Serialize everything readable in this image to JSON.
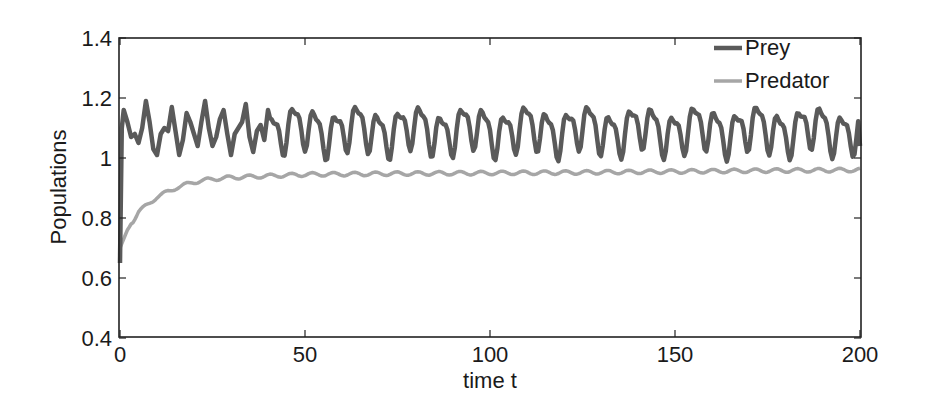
{
  "chart_data": {
    "type": "line",
    "title": "",
    "xlabel": "time t",
    "ylabel": "Populations",
    "xlim": [
      0,
      200
    ],
    "ylim": [
      0.4,
      1.4
    ],
    "xticks": [
      0,
      50,
      100,
      150,
      200
    ],
    "xtick_labels": [
      "0",
      "50",
      "100",
      "150",
      "200"
    ],
    "yticks": [
      0.4,
      0.6,
      0.8,
      1.0,
      1.2,
      1.4
    ],
    "ytick_labels": [
      "0.4",
      "0.6",
      "0.8",
      "1",
      "1.2",
      "1.4"
    ],
    "grid": false,
    "legend_position": "upper right",
    "series": [
      {
        "name": "Prey",
        "color": "#5a5a5a",
        "description": "Starts near 0.65 at t=0, jumps to ~1.16, then oscillates irregularly between ~1.01 and ~1.19 with period ~5.7 and secondary bumps near 1.07-1.10; ends ~1.04 at t=200",
        "x": [
          0,
          0.5,
          1,
          2,
          3,
          4,
          5,
          6,
          7,
          8,
          9,
          10,
          11,
          12,
          13,
          14,
          15,
          16,
          17,
          18,
          19,
          20,
          21,
          22,
          23,
          24,
          25,
          26,
          27,
          28,
          29,
          30,
          31,
          32,
          33,
          34,
          35,
          36,
          37,
          38,
          39,
          40
        ],
        "values": [
          0.65,
          1.1,
          1.16,
          1.12,
          1.07,
          1.08,
          1.05,
          1.1,
          1.19,
          1.12,
          1.03,
          1.01,
          1.08,
          1.1,
          1.09,
          1.17,
          1.09,
          1.01,
          1.06,
          1.15,
          1.12,
          1.08,
          1.04,
          1.12,
          1.19,
          1.1,
          1.04,
          1.07,
          1.13,
          1.16,
          1.08,
          1.01,
          1.08,
          1.1,
          1.12,
          1.18,
          1.07,
          1.02,
          1.09,
          1.11,
          1.06,
          1.16
        ]
      },
      {
        "name": "Predator",
        "color": "#a6a6a6",
        "description": "Starts at 0.70, rises quickly and saturates near ~0.94-0.96 with small wiggles, ending ~0.96 at t=200",
        "x": [
          0,
          2,
          5,
          10,
          15,
          20,
          25,
          30,
          40,
          50,
          75,
          100,
          125,
          150,
          175,
          200
        ],
        "values": [
          0.7,
          0.76,
          0.82,
          0.87,
          0.9,
          0.92,
          0.93,
          0.935,
          0.94,
          0.945,
          0.948,
          0.95,
          0.952,
          0.955,
          0.958,
          0.96
        ]
      }
    ],
    "prey_oscillation": {
      "mean": 1.095,
      "amplitude_range": [
        1.01,
        1.19
      ],
      "period": 5.7
    }
  }
}
